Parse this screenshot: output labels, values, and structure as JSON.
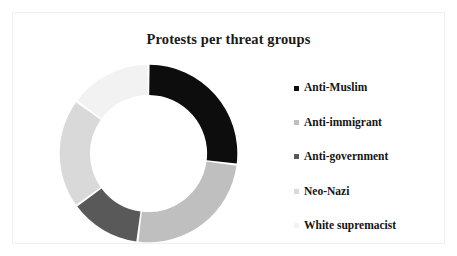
{
  "chart_data": {
    "type": "pie",
    "variant": "donut",
    "title": "Protests per threat groups",
    "xlabel": "",
    "ylabel": "",
    "grid": false,
    "legend_position": "right",
    "start_angle_deg": 0,
    "direction": "clockwise",
    "inner_radius_ratio": 0.66,
    "categories": [
      "Anti-Muslim",
      "Anti-immigrant",
      "Anti-government",
      "Neo-Nazi",
      "White supremacist"
    ],
    "values": [
      27,
      25,
      13,
      20,
      15
    ],
    "value_unit": "percent",
    "colors": [
      "#0d0d0d",
      "#bfbfbf",
      "#595959",
      "#d9d9d9",
      "#f2f2f2"
    ],
    "slices": [
      {
        "label": "Anti-Muslim",
        "value": 27,
        "color": "#0d0d0d"
      },
      {
        "label": "Anti-immigrant",
        "value": 25,
        "color": "#bfbfbf"
      },
      {
        "label": "Anti-government",
        "value": 13,
        "color": "#595959"
      },
      {
        "label": "Neo-Nazi",
        "value": 20,
        "color": "#d9d9d9"
      },
      {
        "label": "White supremacist",
        "value": 15,
        "color": "#f2f2f2"
      }
    ]
  },
  "title": {
    "text": "Protests per threat groups"
  },
  "legend": {
    "items": [
      {
        "label": "Anti-Muslim",
        "color": "#0d0d0d"
      },
      {
        "label": "Anti-immigrant",
        "color": "#bfbfbf"
      },
      {
        "label": "Anti-government",
        "color": "#595959"
      },
      {
        "label": "Neo-Nazi",
        "color": "#d9d9d9"
      },
      {
        "label": "White supremacist",
        "color": "#f2f2f2"
      }
    ]
  },
  "style": {
    "background": "#ffffff",
    "border_color": "#f0f0f0",
    "title_color": "#1a1a1a",
    "label_color": "#141414",
    "slice_gap_color": "#ffffff"
  }
}
